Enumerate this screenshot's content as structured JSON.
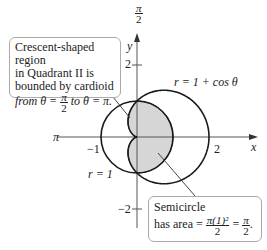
{
  "figure": {
    "axes": {
      "x_label": "x",
      "y_label": "y",
      "top_angle_label": {
        "num": "π",
        "den": "2"
      },
      "left_angle_label": "π",
      "x_ticks": [
        "−1",
        "2"
      ],
      "y_ticks": [
        "2",
        "−2"
      ]
    },
    "curves": {
      "circle_label": "r = 1",
      "cardioid_label": "r = 1 + cos θ"
    },
    "callouts": {
      "crescent": {
        "line1": "Crescent-shaped region",
        "line2": "in Quadrant II is",
        "line3": "bounded by cardioid",
        "line4_pre": "from θ = ",
        "line4_frac_num": "π",
        "line4_frac_den": "2",
        "line4_post": " to θ = π."
      },
      "semicircle": {
        "line1": "Semicircle",
        "line2_pre": "has area = ",
        "frac1_num": "π(1)²",
        "frac1_den": "2",
        "eq": " = ",
        "frac2_num": "π",
        "frac2_den": "2",
        "end": "."
      }
    },
    "colors": {
      "shade": "#d6d6d6",
      "curve": "#1a1a1a",
      "axis": "#555555",
      "callout_border": "#aaaaaa"
    }
  }
}
